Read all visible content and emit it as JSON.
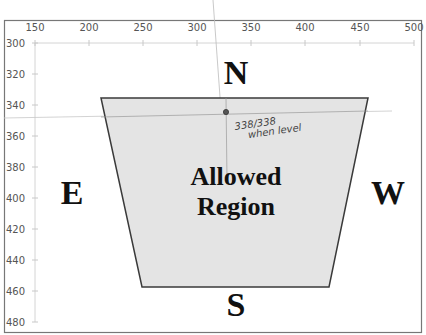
{
  "chart_data": {
    "type": "scatter",
    "title": "",
    "xlabel": "",
    "ylabel": "",
    "x_axis": {
      "position": "top",
      "range": [
        150,
        500
      ],
      "ticks": [
        150,
        200,
        250,
        300,
        350,
        400,
        450,
        500
      ]
    },
    "y_axis": {
      "reversed": true,
      "range": [
        300,
        480
      ],
      "ticks": [
        300,
        320,
        340,
        360,
        380,
        400,
        420,
        440,
        460,
        480
      ]
    },
    "grid": false,
    "legend": null,
    "shapes": [
      {
        "name": "Allowed Region",
        "type": "polygon",
        "fill": "#e4e4e4",
        "stroke": "#333333",
        "points": [
          [
            212,
            335
          ],
          [
            458,
            335
          ],
          [
            422,
            457
          ],
          [
            250,
            457
          ]
        ]
      }
    ],
    "points": [
      {
        "x": 330,
        "y": 344,
        "label": "338/338 when level"
      }
    ],
    "annotations": [
      {
        "text": "N",
        "x": 335,
        "y": 322
      },
      {
        "text": "S",
        "x": 335,
        "y": 470
      },
      {
        "text": "E",
        "x": 170,
        "y": 400
      },
      {
        "text": "W",
        "x": 462,
        "y": 400
      },
      {
        "text": "Allowed Region",
        "x": 335,
        "y": 400
      },
      {
        "text": "338/338 when level",
        "x": 338,
        "y": 352,
        "handwritten": true
      }
    ]
  },
  "labels": {
    "north": "N",
    "south": "S",
    "east": "E",
    "west": "W",
    "region_line1": "Allowed",
    "region_line2": "Region",
    "annotation_line1": "338/338",
    "annotation_line2": "when level"
  },
  "x_ticks": [
    {
      "label": "150",
      "px": 35
    },
    {
      "label": "200",
      "px": 89
    },
    {
      "label": "250",
      "px": 143
    },
    {
      "label": "300",
      "px": 197
    },
    {
      "label": "350",
      "px": 251
    },
    {
      "label": "400",
      "px": 305
    },
    {
      "label": "450",
      "px": 360
    },
    {
      "label": "500",
      "px": 414
    }
  ],
  "y_ticks": [
    {
      "label": "300",
      "px": 43
    },
    {
      "label": "320",
      "px": 74
    },
    {
      "label": "340",
      "px": 105
    },
    {
      "label": "360",
      "px": 136
    },
    {
      "label": "380",
      "px": 167
    },
    {
      "label": "400",
      "px": 198
    },
    {
      "label": "420",
      "px": 229
    },
    {
      "label": "440",
      "px": 260
    },
    {
      "label": "460",
      "px": 291
    },
    {
      "label": "480",
      "px": 322
    }
  ],
  "colors": {
    "region_fill": "#e4e4e4",
    "region_stroke": "#3a3a3a",
    "axis": "#cfcfcf",
    "frame": "#777777",
    "text": "#111111"
  }
}
